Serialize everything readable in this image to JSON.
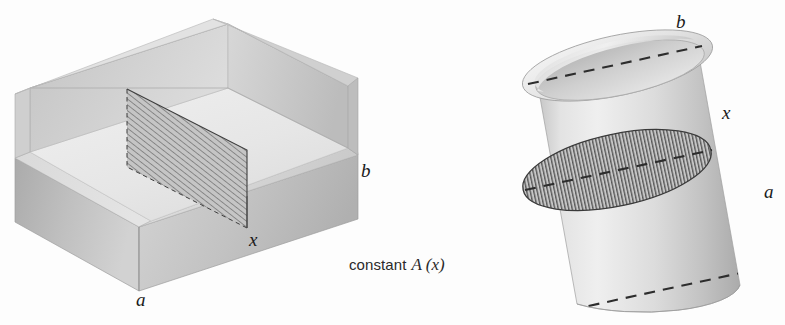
{
  "figure": {
    "background_color": "#fdfdfd",
    "ink_color": "#1a1a1a",
    "caption": {
      "word": "constant",
      "math": "A (x)",
      "x": 349,
      "y": 262
    },
    "left_solid": {
      "name": "rectangular-box",
      "description": "open-top rectangular prism in oblique projection with a hatched vertical cross-section plane",
      "labels": [
        {
          "id": "box-label-a",
          "text": "a",
          "x": 136,
          "y": 296
        },
        {
          "id": "box-label-b",
          "text": "b",
          "x": 361,
          "y": 163
        },
        {
          "id": "box-label-x",
          "text": "x",
          "x": 249,
          "y": 232
        }
      ],
      "faces": {
        "front_left_wall": "#b9b9b9",
        "front_right_wall": "#c6c6c6",
        "interior_floor": "#e9e9e9",
        "interior_back_left": "#d3d3d3",
        "interior_back_right": "#c9c9c9",
        "rim_top": "#dcdcdc"
      },
      "cross_section": {
        "fill": "#c4c4c4",
        "hatch_color": "#5a5a5a",
        "hatch_spacing_px": 4.5,
        "hatch_angle_deg": 52
      }
    },
    "right_solid": {
      "name": "cylinder",
      "description": "tilted open-top circular cylinder with hatched elliptical cross-section and dashed diameter chords",
      "tilt_deg": -12,
      "labels": [
        {
          "id": "cyl-label-b",
          "text": "b",
          "x": 676,
          "y": 14
        },
        {
          "id": "cyl-label-x",
          "text": "x",
          "x": 722,
          "y": 105
        },
        {
          "id": "cyl-label-a",
          "text": "a",
          "x": 764,
          "y": 184
        }
      ],
      "faces": {
        "body_light": "#ececec",
        "body_mid": "#cfcfcf",
        "body_dark": "#b4b4b4",
        "interior_rim": "#d8d8d8",
        "interior_shadow": "#bdbdbd"
      },
      "cross_section": {
        "fill": "#c2c2c2",
        "hatch_color": "#4e4e4e",
        "hatch_spacing_px": 3.4,
        "hatch_angle_deg": 90
      },
      "dashed_chords": [
        {
          "id": "chord-b",
          "label": "b"
        },
        {
          "id": "chord-x",
          "label": "x"
        },
        {
          "id": "chord-a",
          "label": "a"
        }
      ]
    }
  }
}
